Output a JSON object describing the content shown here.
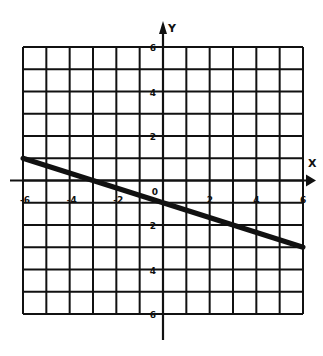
{
  "chart_data": {
    "type": "line",
    "title": "",
    "xlabel": "X",
    "ylabel": "Y",
    "xlim": [
      -6,
      6
    ],
    "ylim": [
      -6,
      6
    ],
    "grid": true,
    "grid_step": 1,
    "x_ticks": [
      -6,
      -4,
      -2,
      0,
      2,
      4,
      6
    ],
    "y_ticks": [
      6,
      4,
      2,
      -2,
      -4,
      -6
    ],
    "x_tick_labels": [
      "-6",
      "-4",
      "-2",
      "0",
      "2",
      "4",
      "6"
    ],
    "y_tick_labels": [
      "6",
      "4",
      "2",
      "-2",
      "-4",
      "-6"
    ],
    "origin_label": "0",
    "series": [
      {
        "name": "line",
        "equation": "y = -x/3 - 1",
        "x": [
          -6,
          6
        ],
        "y": [
          1,
          -3
        ]
      }
    ],
    "colors": {
      "ink": "#111111",
      "background": "#ffffff"
    }
  }
}
